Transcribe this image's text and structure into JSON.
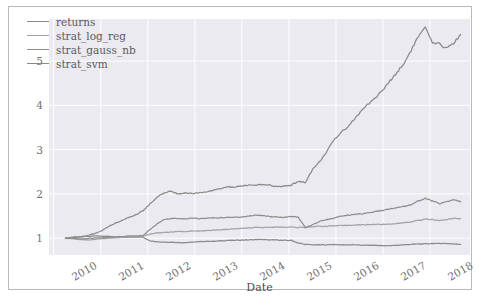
{
  "figure": {
    "background": "#ffffff",
    "border_color": "#b9b9b9",
    "plot_background": "#eaeaf0",
    "grid_color": "#ffffff"
  },
  "chart_data": {
    "type": "line",
    "title": "",
    "xlabel": "Date",
    "ylabel": "",
    "grid": true,
    "legend_position": "upper left",
    "xlim": [
      2009.9,
      2018.85
    ],
    "ylim": [
      0.62,
      5.95
    ],
    "xticks": [
      "2010",
      "2011",
      "2012",
      "2013",
      "2014",
      "2015",
      "2016",
      "2017",
      "2018"
    ],
    "xtick_values": [
      2010,
      2011,
      2012,
      2013,
      2014,
      2015,
      2016,
      2017,
      2018
    ],
    "yticks": [
      "1",
      "2",
      "3",
      "4",
      "5"
    ],
    "ytick_values": [
      1,
      2,
      3,
      4,
      5
    ],
    "series": [
      {
        "name": "returns",
        "color": "#8b8b8b",
        "x": [
          2010.25,
          2010.4,
          2010.55,
          2010.7,
          2010.85,
          2011.0,
          2011.15,
          2011.3,
          2011.45,
          2011.6,
          2011.75,
          2011.9,
          2012.05,
          2012.2,
          2012.35,
          2012.5,
          2012.65,
          2012.8,
          2012.95,
          2013.1,
          2013.25,
          2013.4,
          2013.55,
          2013.7,
          2013.85,
          2014.0,
          2014.15,
          2014.3,
          2014.45,
          2014.6,
          2014.75,
          2014.9,
          2015.05,
          2015.2,
          2015.35,
          2015.5,
          2015.65,
          2015.8,
          2015.95,
          2016.1,
          2016.25,
          2016.4,
          2016.55,
          2016.7,
          2016.85,
          2017.0,
          2017.15,
          2017.3,
          2017.45,
          2017.6,
          2017.75,
          2017.9,
          2018.05,
          2018.2,
          2018.35,
          2018.5,
          2018.65
        ],
        "y": [
          1.0,
          1.01,
          1.03,
          1.04,
          1.05,
          1.05,
          1.04,
          1.03,
          1.02,
          1.02,
          1.03,
          1.02,
          0.94,
          0.92,
          0.91,
          0.91,
          0.9,
          0.9,
          0.91,
          0.92,
          0.93,
          0.93,
          0.94,
          0.95,
          0.95,
          0.96,
          0.96,
          0.97,
          0.97,
          0.96,
          0.96,
          0.95,
          0.95,
          0.89,
          0.86,
          0.85,
          0.85,
          0.85,
          0.86,
          0.85,
          0.85,
          0.85,
          0.84,
          0.84,
          0.84,
          0.83,
          0.83,
          0.84,
          0.85,
          0.86,
          0.87,
          0.87,
          0.88,
          0.88,
          0.88,
          0.87,
          0.86
        ]
      },
      {
        "name": "strat_log_reg",
        "color": "#a3a3a3",
        "x": [
          2010.25,
          2010.4,
          2010.55,
          2010.7,
          2010.85,
          2011.0,
          2011.15,
          2011.3,
          2011.45,
          2011.6,
          2011.75,
          2011.9,
          2012.05,
          2012.2,
          2012.35,
          2012.5,
          2012.65,
          2012.8,
          2012.95,
          2013.1,
          2013.25,
          2013.4,
          2013.55,
          2013.7,
          2013.85,
          2014.0,
          2014.15,
          2014.3,
          2014.45,
          2014.6,
          2014.75,
          2014.9,
          2015.05,
          2015.2,
          2015.35,
          2015.5,
          2015.65,
          2015.8,
          2015.95,
          2016.1,
          2016.25,
          2016.4,
          2016.55,
          2016.7,
          2016.85,
          2017.0,
          2017.15,
          2017.3,
          2017.45,
          2017.6,
          2017.75,
          2017.9,
          2018.05,
          2018.2,
          2018.35,
          2018.5,
          2018.65
        ],
        "y": [
          1.0,
          0.99,
          0.97,
          0.96,
          0.97,
          0.99,
          1.0,
          1.01,
          1.02,
          1.03,
          1.04,
          1.05,
          1.09,
          1.12,
          1.13,
          1.14,
          1.15,
          1.15,
          1.16,
          1.16,
          1.17,
          1.18,
          1.19,
          1.2,
          1.21,
          1.22,
          1.23,
          1.24,
          1.24,
          1.25,
          1.25,
          1.25,
          1.25,
          1.24,
          1.25,
          1.26,
          1.27,
          1.27,
          1.28,
          1.28,
          1.29,
          1.3,
          1.3,
          1.31,
          1.31,
          1.31,
          1.32,
          1.33,
          1.35,
          1.37,
          1.4,
          1.43,
          1.42,
          1.4,
          1.42,
          1.45,
          1.44
        ]
      },
      {
        "name": "strat_gauss_nb",
        "color": "#8f8f8f",
        "x": [
          2010.25,
          2010.4,
          2010.55,
          2010.7,
          2010.85,
          2011.0,
          2011.15,
          2011.3,
          2011.45,
          2011.6,
          2011.75,
          2011.9,
          2012.05,
          2012.2,
          2012.35,
          2012.5,
          2012.65,
          2012.8,
          2012.95,
          2013.1,
          2013.25,
          2013.4,
          2013.55,
          2013.7,
          2013.85,
          2014.0,
          2014.15,
          2014.3,
          2014.45,
          2014.6,
          2014.75,
          2014.9,
          2015.05,
          2015.2,
          2015.35,
          2015.5,
          2015.65,
          2015.8,
          2015.95,
          2016.1,
          2016.25,
          2016.4,
          2016.55,
          2016.7,
          2016.85,
          2017.0,
          2017.15,
          2017.3,
          2017.45,
          2017.6,
          2017.75,
          2017.9,
          2018.05,
          2018.2,
          2018.35,
          2018.5,
          2018.65
        ],
        "y": [
          1.0,
          0.99,
          0.98,
          0.99,
          1.0,
          1.01,
          1.02,
          1.03,
          1.04,
          1.05,
          1.05,
          1.06,
          1.2,
          1.32,
          1.42,
          1.45,
          1.44,
          1.44,
          1.45,
          1.44,
          1.45,
          1.46,
          1.46,
          1.47,
          1.47,
          1.48,
          1.5,
          1.52,
          1.51,
          1.49,
          1.48,
          1.47,
          1.49,
          1.47,
          1.24,
          1.3,
          1.38,
          1.42,
          1.45,
          1.5,
          1.52,
          1.54,
          1.55,
          1.57,
          1.6,
          1.63,
          1.66,
          1.69,
          1.72,
          1.76,
          1.84,
          1.9,
          1.84,
          1.78,
          1.82,
          1.87,
          1.82
        ]
      },
      {
        "name": "strat_svm",
        "color": "#8a8a8a",
        "x": [
          2010.25,
          2010.4,
          2010.55,
          2010.7,
          2010.85,
          2011.0,
          2011.15,
          2011.3,
          2011.45,
          2011.6,
          2011.75,
          2011.9,
          2012.05,
          2012.2,
          2012.35,
          2012.5,
          2012.65,
          2012.8,
          2012.95,
          2013.1,
          2013.25,
          2013.4,
          2013.55,
          2013.7,
          2013.85,
          2014.0,
          2014.15,
          2014.3,
          2014.45,
          2014.6,
          2014.75,
          2014.9,
          2015.05,
          2015.2,
          2015.35,
          2015.5,
          2015.65,
          2015.8,
          2015.95,
          2016.1,
          2016.25,
          2016.4,
          2016.55,
          2016.7,
          2016.85,
          2017.0,
          2017.15,
          2017.3,
          2017.45,
          2017.6,
          2017.75,
          2017.9,
          2018.05,
          2018.2,
          2018.35,
          2018.5,
          2018.65
        ],
        "y": [
          1.0,
          1.02,
          1.03,
          1.05,
          1.1,
          1.16,
          1.25,
          1.33,
          1.4,
          1.47,
          1.53,
          1.62,
          1.78,
          1.93,
          2.02,
          2.06,
          2.0,
          2.02,
          2.0,
          2.03,
          2.05,
          2.08,
          2.12,
          2.16,
          2.15,
          2.18,
          2.2,
          2.19,
          2.21,
          2.2,
          2.16,
          2.17,
          2.2,
          2.28,
          2.26,
          2.55,
          2.72,
          2.95,
          3.2,
          3.38,
          3.52,
          3.7,
          3.88,
          4.05,
          4.18,
          4.35,
          4.55,
          4.75,
          4.95,
          5.25,
          5.55,
          5.75,
          5.4,
          5.38,
          5.3,
          5.4,
          5.6
        ]
      }
    ]
  },
  "legend": {
    "items": [
      {
        "label": "returns"
      },
      {
        "label": "strat_log_reg"
      },
      {
        "label": "strat_gauss_nb"
      },
      {
        "label": "strat_svm"
      }
    ]
  },
  "axis": {
    "x_label": "Date"
  }
}
